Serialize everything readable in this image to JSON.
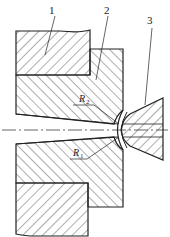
{
  "diagram": {
    "type": "mechanical cross-section",
    "labels": [
      {
        "id": "1",
        "text": "1",
        "x": 52,
        "y": 14
      },
      {
        "id": "2",
        "text": "2",
        "x": 106,
        "y": 14
      },
      {
        "id": "3",
        "text": "3",
        "x": 150,
        "y": 24
      }
    ],
    "radii": [
      {
        "id": "R2",
        "symbol": "R",
        "sub": "2"
      },
      {
        "id": "R1",
        "symbol": "R",
        "sub": "1"
      }
    ]
  }
}
